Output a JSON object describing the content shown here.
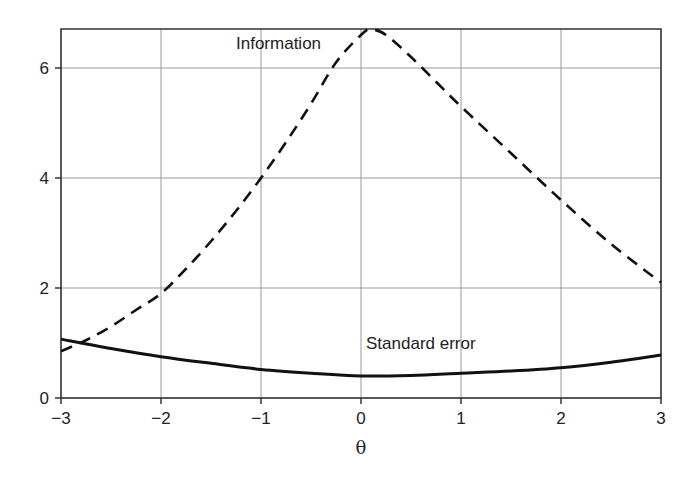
{
  "chart_data": {
    "type": "line",
    "title": "",
    "xlabel": "θ",
    "ylabel": "",
    "xlim": [
      -3,
      3
    ],
    "ylim": [
      0,
      6.7
    ],
    "grid": true,
    "x_ticks": [
      -3,
      -2,
      -1,
      0,
      1,
      2,
      3
    ],
    "x_tick_labels": [
      "−3",
      "−2",
      "−1",
      "0",
      "1",
      "2",
      "3"
    ],
    "y_ticks": [
      0,
      2,
      4,
      6
    ],
    "y_tick_labels": [
      "0",
      "2",
      "4",
      "6"
    ],
    "series": [
      {
        "name": "Information",
        "style": "dashed",
        "x": [
          -3,
          -2.75,
          -2.5,
          -2.25,
          -2,
          -1.75,
          -1.5,
          -1.25,
          -1,
          -0.75,
          -0.5,
          -0.25,
          0,
          0.1,
          0.25,
          0.5,
          0.75,
          1,
          1.5,
          2,
          2.5,
          3
        ],
        "y": [
          0.85,
          1.05,
          1.3,
          1.6,
          1.9,
          2.35,
          2.85,
          3.4,
          4.0,
          4.65,
          5.35,
          6.1,
          6.6,
          6.7,
          6.6,
          6.2,
          5.75,
          5.3,
          4.45,
          3.6,
          2.8,
          2.1
        ]
      },
      {
        "name": "Standard error",
        "style": "solid",
        "x": [
          -3,
          -2.5,
          -2,
          -1.5,
          -1,
          -0.5,
          0,
          0.5,
          1,
          1.5,
          2,
          2.5,
          3
        ],
        "y": [
          1.07,
          0.9,
          0.75,
          0.63,
          0.52,
          0.45,
          0.4,
          0.41,
          0.45,
          0.49,
          0.55,
          0.65,
          0.78
        ]
      }
    ],
    "annotations": [
      {
        "text": "Information",
        "x": -1.25,
        "y": 6.35
      },
      {
        "text": "Standard error",
        "x": 0.05,
        "y": 0.9
      }
    ],
    "legend": "none"
  }
}
